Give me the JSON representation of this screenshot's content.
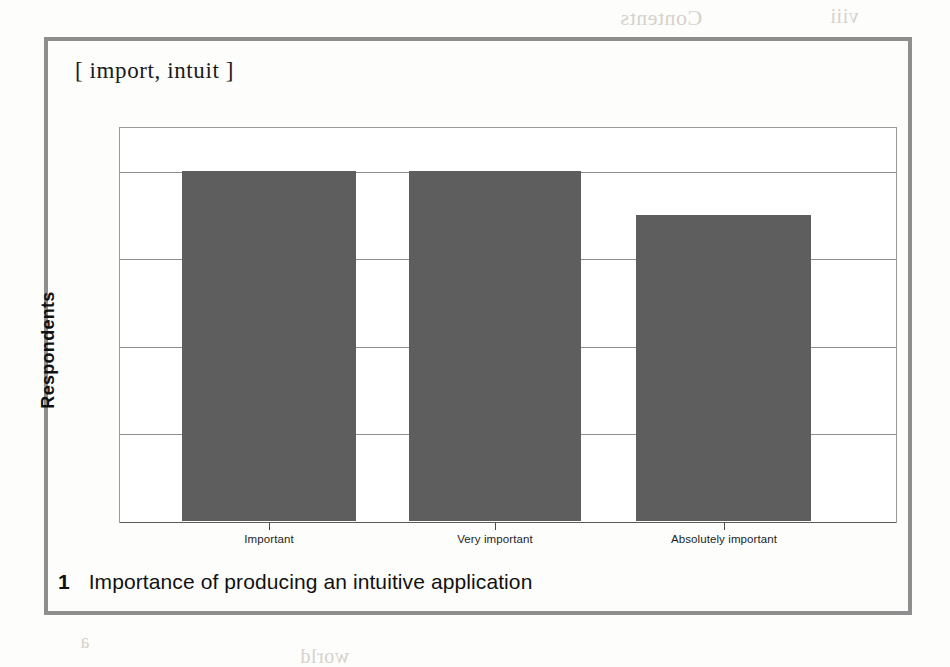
{
  "figure": {
    "chart_title": "[ import, intuit ]",
    "caption_number": "1",
    "caption_text": "Importance of producing an intuitive application",
    "frame_color": "#8e8e8e",
    "page_background": "#fdfdfc"
  },
  "chart_data": {
    "type": "bar",
    "title": "[ import, intuit ]",
    "xlabel": "",
    "ylabel": "Respondents",
    "categories": [
      "Important",
      "Very important",
      "Absolutely important"
    ],
    "values": [
      8,
      8,
      7
    ],
    "ylim": [
      0,
      9
    ],
    "yticks": [
      0,
      2,
      4,
      6,
      8
    ],
    "ytick_labels": [
      "0",
      "2",
      "4",
      "6",
      "8"
    ],
    "grid": true,
    "legend": false,
    "bar_color": "#5e5e5e",
    "plot_background": "#ffffff"
  },
  "bleed_through": [
    {
      "text": "Contents",
      "left": 620,
      "top": 5,
      "size": 22
    },
    {
      "text": "viii",
      "left": 830,
      "top": 5,
      "size": 20
    },
    {
      "text": "Foreword",
      "left": 520,
      "top": 150,
      "size": 21
    },
    {
      "text": "the reader",
      "left": 150,
      "top": 232,
      "size": 20
    },
    {
      "text": "understanding",
      "left": 430,
      "top": 232,
      "size": 20
    },
    {
      "text": "produce",
      "left": 740,
      "top": 232,
      "size": 20
    },
    {
      "text": "it can be",
      "left": 170,
      "top": 262,
      "size": 20
    },
    {
      "text": "of the",
      "left": 440,
      "top": 262,
      "size": 20
    },
    {
      "text": "a simple",
      "left": 690,
      "top": 262,
      "size": 20
    },
    {
      "text": "problem",
      "left": 190,
      "top": 292,
      "size": 20
    },
    {
      "text": "and how",
      "left": 460,
      "top": 292,
      "size": 20
    },
    {
      "text": "is brought",
      "left": 700,
      "top": 292,
      "size": 20
    },
    {
      "text": "that this",
      "left": 200,
      "top": 322,
      "size": 20
    },
    {
      "text": "effort",
      "left": 470,
      "top": 322,
      "size": 20
    },
    {
      "text": "and so",
      "left": 720,
      "top": 322,
      "size": 20
    },
    {
      "text": "has been",
      "left": 170,
      "top": 352,
      "size": 20
    },
    {
      "text": "the few",
      "left": 450,
      "top": 352,
      "size": 20
    },
    {
      "text": "to make",
      "left": 730,
      "top": 352,
      "size": 20
    },
    {
      "text": "everyone",
      "left": 155,
      "top": 382,
      "size": 20
    },
    {
      "text": "it is not",
      "left": 430,
      "top": 382,
      "size": 20
    },
    {
      "text": "produced",
      "left": 690,
      "top": 382,
      "size": 20
    },
    {
      "text": "writing",
      "left": 210,
      "top": 412,
      "size": 20
    },
    {
      "text": "of a clear",
      "left": 470,
      "top": 412,
      "size": 20
    },
    {
      "text": "a",
      "left": 760,
      "top": 412,
      "size": 20
    },
    {
      "text": "players",
      "left": 175,
      "top": 442,
      "size": 20
    },
    {
      "text": "and",
      "left": 470,
      "top": 442,
      "size": 20
    },
    {
      "text": "become",
      "left": 660,
      "top": 442,
      "size": 20
    },
    {
      "text": "solution",
      "left": 200,
      "top": 472,
      "size": 20
    },
    {
      "text": "which is to",
      "left": 450,
      "top": 472,
      "size": 20
    },
    {
      "text": "design",
      "left": 740,
      "top": 472,
      "size": 20
    },
    {
      "text": "the",
      "left": 790,
      "top": 500,
      "size": 20
    },
    {
      "text": "a",
      "left": 80,
      "top": 630,
      "size": 20
    },
    {
      "text": "world",
      "left": 300,
      "top": 645,
      "size": 20
    }
  ]
}
